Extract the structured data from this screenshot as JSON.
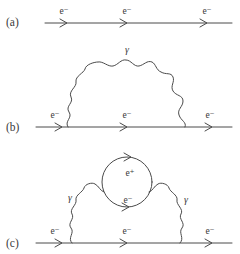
{
  "figure": {
    "background_color": "#ffffff",
    "line_color": "#4a4a4a",
    "text_color": "#3a3a3a",
    "caption_style": "feynman-diagrams"
  },
  "panels": [
    {
      "id": "a",
      "label": "(a)",
      "description": "bare electron propagator",
      "fermion_labels": [
        "e⁻",
        "e⁻",
        "e⁻"
      ],
      "photon_labels": []
    },
    {
      "id": "b",
      "label": "(b)",
      "description": "electron self-energy with one virtual photon loop",
      "fermion_labels": [
        "e⁻",
        "e⁻",
        "e⁻"
      ],
      "photon_labels": [
        "γ"
      ]
    },
    {
      "id": "c",
      "label": "(c)",
      "description": "electron self-energy with vacuum polarization electron-positron loop",
      "fermion_labels": [
        "e⁻",
        "e⁻",
        "e⁻"
      ],
      "photon_labels": [
        "γ",
        "γ"
      ],
      "loop_labels": [
        "e⁺",
        "e⁻"
      ]
    }
  ],
  "labels": {
    "panel_a": "(a)",
    "panel_b": "(b)",
    "panel_c": "(c)",
    "electron": "e⁻",
    "positron": "e⁺",
    "photon": "γ",
    "a_electron_1": "e⁻",
    "a_electron_2": "e⁻",
    "a_electron_3": "e⁻",
    "b_electron_1": "e⁻",
    "b_electron_2": "e⁻",
    "b_electron_3": "e⁻",
    "b_photon": "γ",
    "c_electron_1": "e⁻",
    "c_electron_2": "e⁻",
    "c_electron_3": "e⁻",
    "c_photon_left": "γ",
    "c_photon_right": "γ",
    "c_loop_top": "e⁺",
    "c_loop_bottom": "e⁻"
  }
}
